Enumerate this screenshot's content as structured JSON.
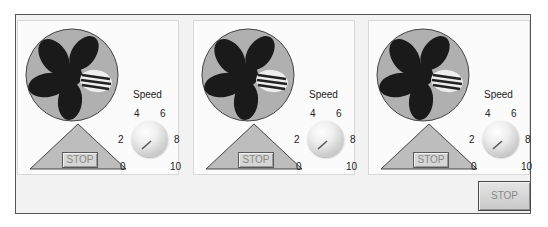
{
  "panels": [
    {
      "id": "fan-1",
      "stop_label": "STOP",
      "knob": {
        "label": "Speed",
        "ticks": [
          "0",
          "2",
          "4",
          "6",
          "8",
          "10"
        ],
        "value": 1
      }
    },
    {
      "id": "fan-2",
      "stop_label": "STOP",
      "knob": {
        "label": "Speed",
        "ticks": [
          "0",
          "2",
          "4",
          "6",
          "8",
          "10"
        ],
        "value": 1
      }
    },
    {
      "id": "fan-3",
      "stop_label": "STOP",
      "knob": {
        "label": "Speed",
        "ticks": [
          "0",
          "2",
          "4",
          "6",
          "8",
          "10"
        ],
        "value": 1
      }
    }
  ],
  "main_stop_label": "STOP",
  "colors": {
    "fan_housing": "#b0b0b0",
    "fan_blade": "#1a1a1a",
    "base_triangle": "#bdbdbd",
    "frame_border": "#555555"
  }
}
